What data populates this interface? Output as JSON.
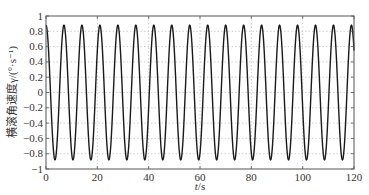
{
  "chart_data": {
    "type": "line",
    "title": "",
    "xlabel": "t/s",
    "ylabel": "横滚角速度γ/(°·s⁻¹)",
    "xlim": [
      0,
      120
    ],
    "ylim": [
      -1,
      1
    ],
    "xticks": [
      0,
      20,
      40,
      60,
      80,
      100,
      120
    ],
    "xtick_labels": [
      "0",
      "20",
      "40",
      "60",
      "80",
      "100",
      "120"
    ],
    "yticks": [
      1,
      0.8,
      0.6,
      0.4,
      0.2,
      0,
      -0.2,
      -0.4,
      -0.6,
      -0.8,
      -1
    ],
    "ytick_labels": [
      "1",
      "0.8",
      "0.6",
      "0.4",
      "0.2",
      "0",
      "−0.2",
      "−0.4",
      "−0.6",
      "−0.8",
      "−1"
    ],
    "grid": true,
    "legend": null,
    "series": [
      {
        "name": "roll rate",
        "color": "#1a1a1a",
        "function": "0.88*cos(2*pi*t/7.0)",
        "amplitude": 0.88,
        "period_s": 7.0,
        "x": [
          0,
          3.5,
          7,
          10.5,
          14,
          17.5,
          21,
          24.5,
          28,
          31.5,
          35,
          38.5,
          42,
          45.5,
          49,
          52.5,
          56,
          59.5,
          63,
          66.5,
          70,
          73.5,
          77,
          80.5,
          84,
          87.5,
          91,
          94.5,
          98,
          101.5,
          105,
          108.5,
          112,
          115.5,
          119,
          120
        ],
        "y": [
          0.88,
          -0.88,
          0.88,
          -0.88,
          0.88,
          -0.88,
          0.88,
          -0.88,
          0.88,
          -0.88,
          0.88,
          -0.88,
          0.88,
          -0.88,
          0.88,
          -0.88,
          0.88,
          -0.88,
          0.88,
          -0.88,
          0.88,
          -0.88,
          0.88,
          -0.88,
          0.88,
          -0.88,
          0.88,
          -0.88,
          0.88,
          -0.88,
          0.88,
          -0.88,
          0.88,
          -0.88,
          0.88,
          0.55
        ]
      }
    ]
  },
  "labels": {
    "xlabel_italic": "t",
    "xlabel_unit": "/s",
    "ylabel": "横滚角速度γ/(°·s⁻¹)"
  }
}
